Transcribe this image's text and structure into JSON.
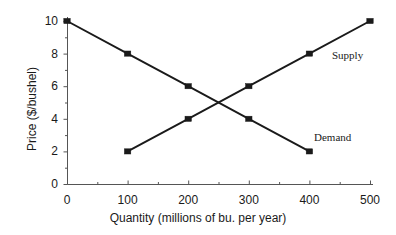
{
  "chart_data": {
    "type": "line",
    "title": "",
    "xlabel": "Quantity  (millions of bu. per year)",
    "ylabel": "Price ($/bushel)",
    "xlim": [
      0,
      500
    ],
    "ylim": [
      0,
      10
    ],
    "grid": false,
    "legend_position": "inline-end-of-line",
    "x_ticks": [
      0,
      100,
      200,
      300,
      400,
      500
    ],
    "x_tick_labels": [
      "0",
      "100",
      "200",
      "300",
      "400",
      "500"
    ],
    "x_minor_step": 50,
    "y_ticks": [
      0,
      2,
      4,
      6,
      8,
      10
    ],
    "y_tick_labels": [
      "0",
      "2",
      "4",
      "6",
      "8",
      "10"
    ],
    "y_minor_step": 1,
    "series": [
      {
        "name": "Demand",
        "label": "Demand",
        "marker": "square",
        "color": "#1a1a1a",
        "x": [
          0,
          100,
          200,
          300,
          400
        ],
        "values": [
          10,
          8,
          6,
          4,
          2
        ]
      },
      {
        "name": "Supply",
        "label": "Supply",
        "marker": "square",
        "color": "#1a1a1a",
        "x": [
          100,
          200,
          300,
          400,
          500
        ],
        "values": [
          2,
          4,
          6,
          8,
          10
        ]
      }
    ],
    "equilibrium": {
      "quantity": 250,
      "price": 5
    },
    "colors": {
      "line": "#1a1a1a",
      "axis": "#555555",
      "text": "#1a1a1a",
      "background": "#ffffff"
    }
  },
  "labels": {
    "supply": "Supply",
    "demand": "Demand"
  }
}
